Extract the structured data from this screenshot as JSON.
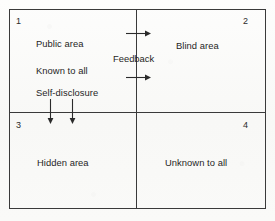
{
  "diagram": {
    "type": "2x2 quadrant matrix",
    "frame_color": "#3a3a3a",
    "background_color": "#fbfbfa",
    "text_color": "#1f1f1f"
  },
  "quadrants": [
    {
      "number": "1",
      "position": "top-left",
      "lines": [
        "Public area",
        "Known to all",
        "Self-disclosure"
      ]
    },
    {
      "number": "2",
      "position": "top-right",
      "lines": [
        "Blind area"
      ]
    },
    {
      "number": "3",
      "position": "bottom-left",
      "lines": [
        "Hidden area"
      ]
    },
    {
      "number": "4",
      "position": "bottom-right",
      "lines": [
        "Unknown to all"
      ]
    }
  ],
  "labels": {
    "quad1_line1": "Public area",
    "quad1_line2": "Known to all",
    "quad1_line3": "Self-disclosure",
    "quad2_line1": "Blind area",
    "quad3_line1": "Hidden area",
    "quad4_line1": "Unknown to all",
    "feedback": "Feedback",
    "num1": "1",
    "num2": "2",
    "num3": "3",
    "num4": "4"
  },
  "arrows": [
    {
      "name": "feedback-arrow-top",
      "direction": "right",
      "from": [
        126,
        33
      ],
      "to": [
        150,
        33
      ],
      "crosses": "vertical-divider"
    },
    {
      "name": "feedback-arrow-bottom",
      "direction": "right",
      "from": [
        126,
        77
      ],
      "to": [
        150,
        77
      ],
      "crosses": "vertical-divider"
    },
    {
      "name": "self-disclosure-arrow-left",
      "direction": "down",
      "from": [
        50,
        99
      ],
      "to": [
        50,
        123
      ],
      "crosses": "horizontal-divider"
    },
    {
      "name": "self-disclosure-arrow-right",
      "direction": "down",
      "from": [
        72,
        99
      ],
      "to": [
        72,
        123
      ],
      "crosses": "horizontal-divider"
    }
  ]
}
